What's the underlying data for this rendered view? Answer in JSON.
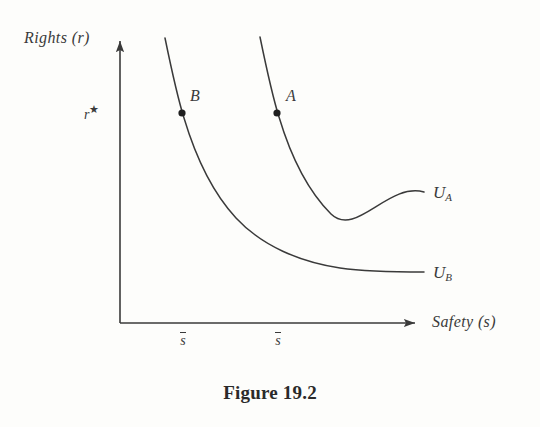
{
  "figure": {
    "caption": "Figure 19.2",
    "caption_y": 382
  },
  "axes": {
    "x_title": "Safety (s)",
    "y_title": "Rights (r)",
    "y_tick_label": "r",
    "y_tick_superscript": "★",
    "origin": {
      "x": 120,
      "y": 323
    },
    "x_axis_end": {
      "x": 420,
      "y": 323
    },
    "y_axis_top": {
      "x": 120,
      "y": 38
    },
    "ink_color": "#3a3a3a",
    "background_color": "#fdfdfb",
    "x_ticks": [
      {
        "label": "s",
        "overbar": true,
        "x": 182
      },
      {
        "label": "s",
        "overbar": true,
        "x": 277
      }
    ]
  },
  "chart_data": {
    "type": "line",
    "title": "Figure 19.2",
    "xlabel": "Safety (s)",
    "ylabel": "Rights (r)",
    "grid": false,
    "legend": "inline-right",
    "annotations": [
      {
        "text": "r★",
        "role": "y-axis-marker",
        "axis": "y",
        "pixel_y": 113
      },
      {
        "text": "s̄",
        "role": "x-axis-marker",
        "axis": "x",
        "pixel_x": 182
      },
      {
        "text": "s̄",
        "role": "x-axis-marker",
        "axis": "x",
        "pixel_x": 277
      }
    ],
    "series": [
      {
        "name": "U_B",
        "label": "U",
        "label_sub": "B",
        "description": "Lower indifference curve passing through point B",
        "label_pos": {
          "x": 434,
          "y": 272
        },
        "path": "M 165,38 C 172,72 177,96 184,118 C 196,158 212,192 236,218 C 262,246 300,262 340,268 C 368,272 400,272 424,272",
        "points": [
          {
            "name": "B",
            "x": 182,
            "y": 113,
            "label_pos": {
              "x": 190,
              "y": 95
            }
          }
        ]
      },
      {
        "name": "U_A",
        "label": "U",
        "label_sub": "A",
        "description": "Upper indifference curve passing through point A",
        "label_pos": {
          "x": 438,
          "y": 192
        },
        "path": "M 260,37 C 267,71 272,95 279,117 C 291,157 307,190 331,215 C 357,242 392,258 424,192",
        "path_fixed": "M 260,37 C 267,71 272,95 279,117 C 291,157 307,190 331,214 C 356,238 388,182 424,192",
        "points": [
          {
            "name": "A",
            "x": 277,
            "y": 113,
            "label_pos": {
              "x": 286,
              "y": 95
            }
          }
        ]
      }
    ]
  },
  "labels": {
    "y_axis_title_pos": {
      "x": 24,
      "y": 30
    },
    "x_axis_title_pos": {
      "x": 432,
      "y": 314
    },
    "y_star_pos": {
      "x": 84,
      "y": 104
    },
    "tick_label_y": 332
  }
}
